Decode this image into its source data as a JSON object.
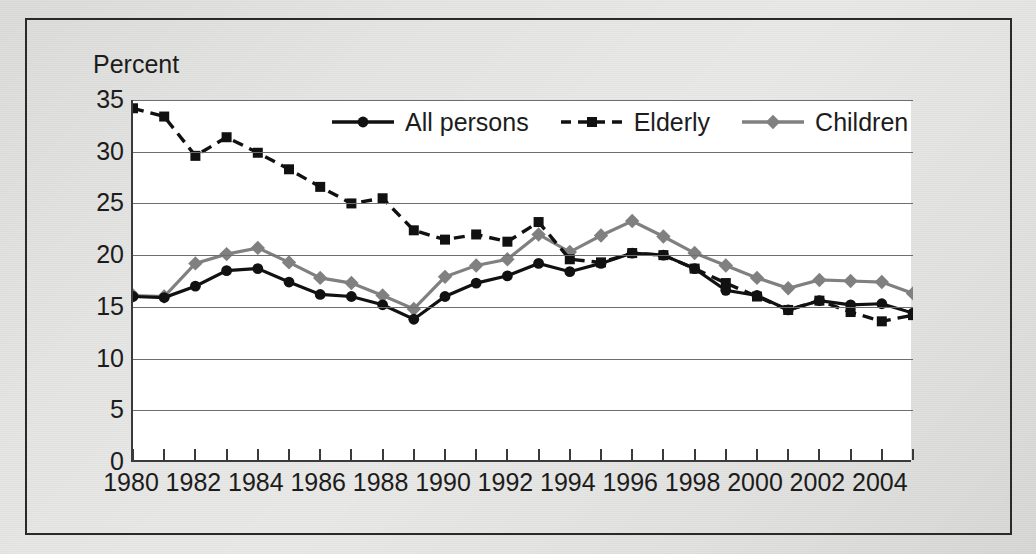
{
  "chart_data": {
    "type": "line",
    "title": "",
    "subtitle": "",
    "xlabel": "",
    "ylabel": "Percent",
    "ylim": [
      0,
      35
    ],
    "xlim": [
      1980,
      2005
    ],
    "ytick_step": 5,
    "yticks": [
      "0",
      "5",
      "10",
      "15",
      "20",
      "25",
      "30",
      "35"
    ],
    "xticks_labeled": [
      "1980",
      "1982",
      "1984",
      "1986",
      "1988",
      "1990",
      "1992",
      "1994",
      "1996",
      "1998",
      "2000",
      "2002",
      "2004"
    ],
    "x": [
      1980,
      1981,
      1982,
      1983,
      1984,
      1985,
      1986,
      1987,
      1988,
      1989,
      1990,
      1991,
      1992,
      1993,
      1994,
      1995,
      1996,
      1997,
      1998,
      1999,
      2000,
      2001,
      2002,
      2003,
      2004,
      2005
    ],
    "grid": true,
    "legend_position": "top-center",
    "series": [
      {
        "name": "All persons",
        "color": "#111111",
        "marker": "circle",
        "dash": "solid",
        "values": [
          16.0,
          15.9,
          17.0,
          18.5,
          18.7,
          17.4,
          16.2,
          16.0,
          15.2,
          13.8,
          16.0,
          17.3,
          18.0,
          19.2,
          18.4,
          19.2,
          20.2,
          20.0,
          18.7,
          16.6,
          16.1,
          14.7,
          15.6,
          15.2,
          15.3,
          14.4
        ]
      },
      {
        "name": "Elderly",
        "color": "#111111",
        "marker": "square",
        "dash": "dashed",
        "values": [
          34.2,
          33.4,
          29.6,
          31.4,
          29.9,
          28.3,
          26.6,
          25.0,
          25.5,
          22.4,
          21.5,
          22.0,
          21.3,
          23.2,
          19.6,
          19.3,
          20.2,
          20.0,
          18.7,
          17.3,
          16.0,
          14.7,
          15.6,
          14.5,
          13.6,
          14.2
        ]
      },
      {
        "name": "Children",
        "color": "#808080",
        "marker": "diamond",
        "dash": "solid",
        "values": [
          16.1,
          16.0,
          19.2,
          20.1,
          20.7,
          19.3,
          17.8,
          17.3,
          16.1,
          14.8,
          17.9,
          19.0,
          19.6,
          22.0,
          20.3,
          21.9,
          23.3,
          21.8,
          20.2,
          19.0,
          17.8,
          16.8,
          17.6,
          17.5,
          17.4,
          16.3
        ]
      }
    ]
  }
}
